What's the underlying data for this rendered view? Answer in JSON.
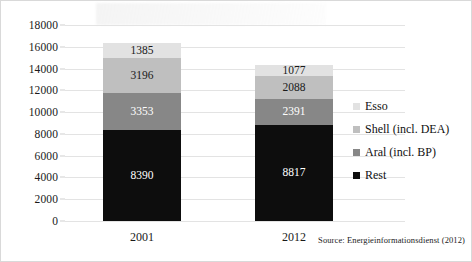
{
  "chart_data": {
    "type": "bar",
    "subtype": "stacked-column",
    "title": "",
    "xlabel": "",
    "ylabel": "",
    "categories": [
      "2001",
      "2012"
    ],
    "ylim": [
      0,
      18000
    ],
    "ytick_step": 2000,
    "yticks": [
      "0",
      "2000",
      "4000",
      "6000",
      "8000",
      "10000",
      "12000",
      "14000",
      "16000",
      "18000"
    ],
    "grid": true,
    "legend_position": "right",
    "stack_order_bottom_to_top": [
      "Rest",
      "Aral (incl. BP)",
      "Shell (incl. DEA)",
      "Esso"
    ],
    "series": [
      {
        "name": "Rest",
        "color": "#0d0d0d",
        "label_color": "#ffffff",
        "values": [
          8390,
          8817
        ],
        "labels": [
          "8390",
          "8817"
        ]
      },
      {
        "name": "Aral (incl. BP)",
        "color": "#878787",
        "label_color": "#ffffff",
        "values": [
          3353,
          2391
        ],
        "labels": [
          "3353",
          "2391"
        ]
      },
      {
        "name": "Shell (incl. DEA)",
        "color": "#bfbfbf",
        "label_color": "#1a1a1a",
        "values": [
          3196,
          2088
        ],
        "labels": [
          "3196",
          "2088"
        ]
      },
      {
        "name": "Esso",
        "color": "#e2e2e2",
        "label_color": "#1a1a1a",
        "values": [
          1385,
          1077
        ],
        "labels": [
          "1385",
          "1077"
        ]
      }
    ],
    "totals": [
      16324,
      14373
    ],
    "annotations": [
      "Source: Energieinformationsdienst (2012)"
    ]
  },
  "legend": {
    "items": [
      {
        "label": "Esso",
        "color": "#e2e2e2"
      },
      {
        "label": "Shell (incl. DEA)",
        "color": "#bfbfbf"
      },
      {
        "label": "Aral (incl. BP)",
        "color": "#878787"
      },
      {
        "label": "Rest",
        "color": "#0d0d0d"
      }
    ]
  },
  "source": {
    "text": "Source: Energieinformationsdienst (2012)"
  }
}
